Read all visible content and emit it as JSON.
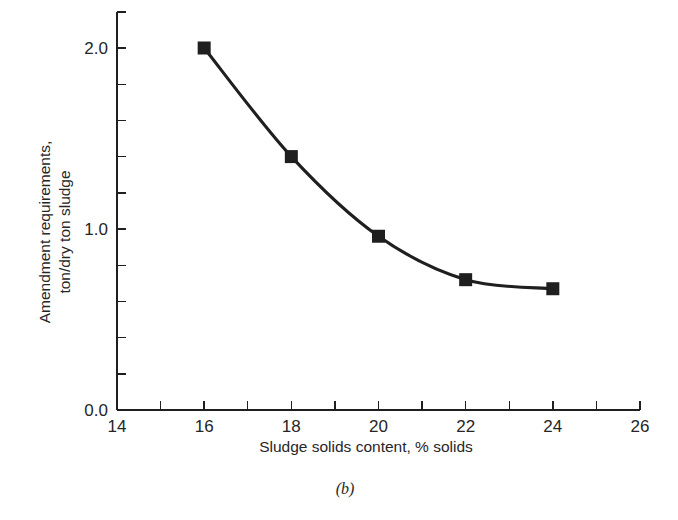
{
  "figure": {
    "caption": "(b)"
  },
  "chart_data": {
    "type": "line",
    "title": "",
    "subtitle": "",
    "xlabel": "Sludge solids content, % solids",
    "ylabel": "Amendment requirements,\nton/dry ton sludge",
    "ylabel_line1": "Amendment requirements,",
    "ylabel_line2": "ton/dry ton sludge",
    "x": [
      16,
      18,
      20,
      22,
      24
    ],
    "values": [
      2.0,
      1.4,
      0.96,
      0.72,
      0.67
    ],
    "series": [
      {
        "name": "Amendment requirement",
        "x": [
          16,
          18,
          20,
          22,
          24
        ],
        "values": [
          2.0,
          1.4,
          0.96,
          0.72,
          0.67
        ],
        "marker": "filled-square",
        "color": "#1f1f1f"
      }
    ],
    "xlim": [
      14,
      26
    ],
    "ylim": [
      0.0,
      2.2
    ],
    "x_major_ticks": [
      14,
      16,
      18,
      20,
      22,
      24,
      26
    ],
    "x_minor_ticks": [
      15,
      17,
      19,
      21,
      23,
      25
    ],
    "x_tick_labels": [
      "14",
      "16",
      "18",
      "20",
      "22",
      "24",
      "26"
    ],
    "y_major_ticks": [
      0.0,
      1.0,
      2.0
    ],
    "y_minor_ticks": [
      0.2,
      0.4,
      0.6,
      0.8,
      1.2,
      1.4,
      1.6,
      1.8,
      2.2
    ],
    "y_tick_labels": [
      "0.0",
      "1.0",
      "2.0"
    ],
    "grid": false,
    "legend": false,
    "legend_position": "none",
    "annotations": []
  },
  "colors": {
    "background": "#ffffff",
    "line": "#1f1f1f",
    "marker": "#1f1f1f",
    "axis": "#1f1f1f",
    "text": "#262626"
  }
}
